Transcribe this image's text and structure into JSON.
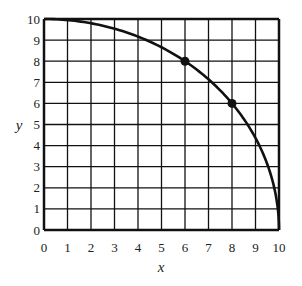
{
  "chart_data": {
    "type": "line",
    "title": "",
    "xlabel": "x",
    "ylabel": "y",
    "xlim": [
      0,
      10
    ],
    "ylim": [
      0,
      10
    ],
    "grid": true,
    "x_ticks": [
      "0",
      "1",
      "2",
      "3",
      "4",
      "5",
      "6",
      "7",
      "8",
      "9",
      "10"
    ],
    "y_ticks": [
      "0",
      "1",
      "2",
      "3",
      "4",
      "5",
      "6",
      "7",
      "8",
      "9",
      "10"
    ],
    "series": [
      {
        "name": "curve",
        "description": "quarter circle x^2 + y^2 = 100",
        "x": [
          0,
          1,
          2,
          3,
          4,
          5,
          6,
          7,
          8,
          9,
          9.5,
          10
        ],
        "y": [
          10,
          9.95,
          9.8,
          9.54,
          9.17,
          8.66,
          8,
          7.14,
          6,
          4.36,
          3.12,
          0
        ]
      }
    ],
    "points": [
      {
        "x": 6,
        "y": 8
      },
      {
        "x": 8,
        "y": 6
      }
    ],
    "colors": {
      "line": "#111111",
      "grid": "#111111"
    }
  }
}
